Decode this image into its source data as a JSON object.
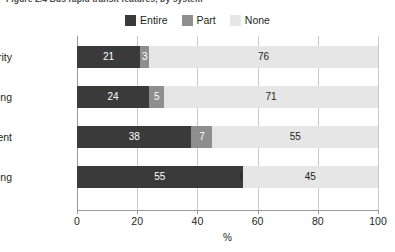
{
  "figure": {
    "title_clipped": "Figure 2.4  Bus rapid transit features, by system",
    "axis_title": "%"
  },
  "legend": {
    "position": "top-center",
    "items": [
      {
        "label": "Entire",
        "color": "#3a3a3a",
        "key": "entire"
      },
      {
        "label": "Part",
        "color": "#8e8e8e",
        "key": "part"
      },
      {
        "label": "None",
        "color": "#e6e6e6",
        "key": "none"
      }
    ]
  },
  "colors": {
    "entire": "#3a3a3a",
    "part": "#8e8e8e",
    "none": "#e6e6e6",
    "grid": "#c9c9c9",
    "axis": "#9a9a9a",
    "text": "#231f20",
    "background": "#ffffff"
  },
  "chart_data": {
    "type": "bar",
    "orientation": "horizontal",
    "stacked": true,
    "title": "Figure 2.4  Bus rapid transit features, by system",
    "xlabel": "%",
    "ylabel": "",
    "xlim": [
      0,
      100
    ],
    "xticks": [
      0,
      20,
      40,
      60,
      80,
      100
    ],
    "xtick_labels": [
      "0",
      "20",
      "40",
      "60",
      "80",
      "100"
    ],
    "grid": true,
    "legend": [
      "Entire",
      "Part",
      "None"
    ],
    "categories": [
      "Signal priority",
      "Overtaking",
      "Pre-payment",
      "Level boarding"
    ],
    "series": [
      {
        "name": "Entire",
        "values": [
          21,
          24,
          38,
          55
        ]
      },
      {
        "name": "Part",
        "values": [
          3,
          5,
          7,
          0
        ]
      },
      {
        "name": "None",
        "values": [
          76,
          71,
          55,
          45
        ]
      }
    ],
    "data_labels": [
      {
        "category": "Signal priority",
        "entire": "21",
        "part": "3",
        "none": "76"
      },
      {
        "category": "Overtaking",
        "entire": "24",
        "part": "5",
        "none": "71"
      },
      {
        "category": "Pre-payment",
        "entire": "38",
        "part": "7",
        "none": "55"
      },
      {
        "category": "Level boarding",
        "entire": "55",
        "part": "0",
        "none": "45"
      }
    ]
  }
}
